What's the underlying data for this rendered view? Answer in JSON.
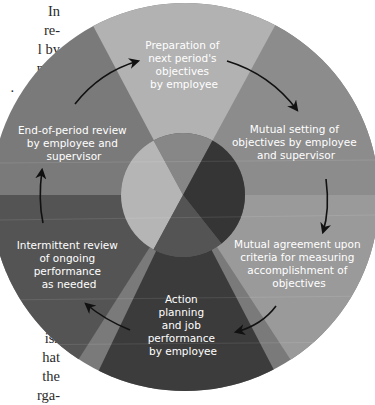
{
  "page_text": {
    "top_fragments": [
      "In",
      "re-",
      "l by",
      "ndi-",
      "."
    ],
    "bottom_fragments": [
      "f",
      "iss",
      "hat",
      "the",
      "rga-"
    ]
  },
  "diagram": {
    "type": "cycle",
    "colors": {
      "top_wedge": "#b2b2b2",
      "upper_right_wedge": "#8c8c8c",
      "lower_right_wedge": "#9a9a9a",
      "bottom_wedge": "#3c3c3c",
      "lower_left_wedge": "#555555",
      "upper_left_wedge": "#7a7a7a",
      "arrow": "#111111",
      "label": "#ffffff"
    },
    "steps": [
      {
        "id": "prep",
        "lines": [
          "Preparation of",
          "next period's",
          "objectives",
          "by employee"
        ]
      },
      {
        "id": "mutual-setting",
        "lines": [
          "Mutual setting of",
          "objectives by employee",
          "and supervisor"
        ]
      },
      {
        "id": "mutual-agreement",
        "lines": [
          "Mutual agreement upon",
          "criteria for measuring",
          "accomplishment of",
          "objectives"
        ]
      },
      {
        "id": "action",
        "lines": [
          "Action",
          "planning",
          "and job",
          "performance",
          "by employee"
        ]
      },
      {
        "id": "intermittent",
        "lines": [
          "Intermittent review",
          "of ongoing",
          "performance",
          "as needed"
        ]
      },
      {
        "id": "end-review",
        "lines": [
          "End-of-period review",
          "by employee and",
          "supervisor"
        ]
      }
    ]
  }
}
